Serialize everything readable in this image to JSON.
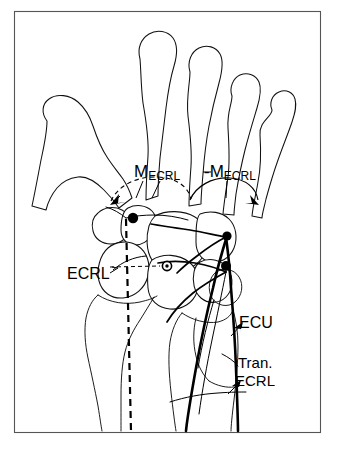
{
  "figure": {
    "frame": {
      "stroke_color": "#555555"
    },
    "background_color": "#ffffff",
    "line_color": "#000000"
  },
  "labels": {
    "moment_radial": {
      "symbol": "M",
      "subscript": "ECRL",
      "prefix": ""
    },
    "moment_ulnar": {
      "symbol": "M",
      "subscript": "ECRL",
      "prefix": "-"
    },
    "ecrl": {
      "text": "ECRL"
    },
    "ecu": {
      "text": "ECU"
    },
    "transverse_ecrl": {
      "line1": "Tran.",
      "line2": "ECRL"
    }
  },
  "markers": {
    "radial_pivot": {
      "name": "radial-insertion-dot"
    },
    "ulnar_pivot_upper": {
      "name": "ulnar-insertion-dot-upper"
    },
    "ulnar_pivot_lower": {
      "name": "ulnar-insertion-dot-lower"
    },
    "rotation_center": {
      "name": "center-of-rotation-marker"
    }
  },
  "anatomy": {
    "metacarpals": [
      "thumb",
      "index",
      "middle",
      "ring",
      "little"
    ],
    "carpal_rows": [
      "distal",
      "proximal"
    ],
    "forearm_bones": [
      "radius",
      "ulna"
    ],
    "tendons": [
      "ECRL",
      "ECU",
      "Transverse ECRL"
    ]
  }
}
